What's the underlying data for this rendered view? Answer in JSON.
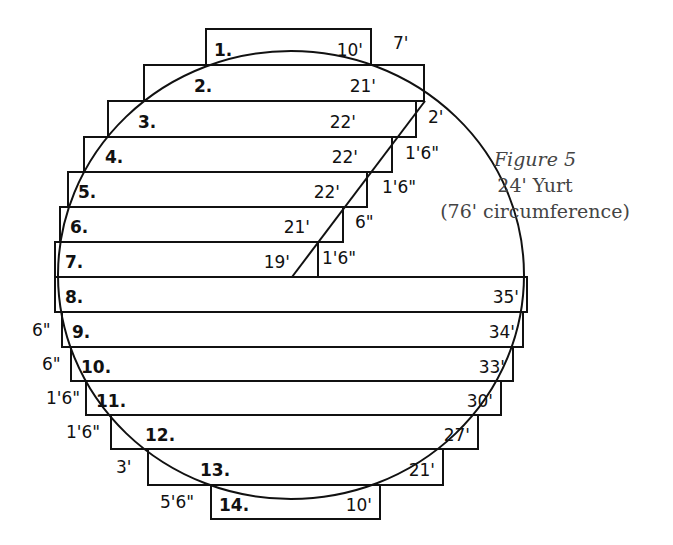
{
  "caption": {
    "title": "Figure 5",
    "line1": "24' Yurt",
    "line2": "(76' circumference)"
  },
  "rows": [
    {
      "n": "1.",
      "len": "10'",
      "x1": 206,
      "x2": 371,
      "y1": 29,
      "y2": 65
    },
    {
      "n": "2.",
      "len": "21'",
      "x1": 144,
      "x2": 424,
      "y1": 65,
      "y2": 101
    },
    {
      "n": "3.",
      "len": "22'",
      "x1": 108,
      "x2": 416,
      "y1": 101,
      "y2": 137
    },
    {
      "n": "4.",
      "len": "22'",
      "x1": 84,
      "x2": 392,
      "y1": 137,
      "y2": 172
    },
    {
      "n": "5.",
      "len": "22'",
      "x1": 68,
      "x2": 367,
      "y1": 172,
      "y2": 207
    },
    {
      "n": "6.",
      "len": "21'",
      "x1": 60,
      "x2": 343,
      "y1": 207,
      "y2": 242
    },
    {
      "n": "7.",
      "len": "19'",
      "x1": 55,
      "x2": 318,
      "y1": 242,
      "y2": 277
    },
    {
      "n": "8.",
      "len": "35'",
      "x1": 55,
      "x2": 527,
      "y1": 277,
      "y2": 312
    },
    {
      "n": "9.",
      "len": "34'",
      "x1": 62,
      "x2": 523,
      "y1": 312,
      "y2": 347
    },
    {
      "n": "10.",
      "len": "33'",
      "x1": 71,
      "x2": 513,
      "y1": 347,
      "y2": 381
    },
    {
      "n": "11.",
      "len": "30'",
      "x1": 86,
      "x2": 501,
      "y1": 381,
      "y2": 415
    },
    {
      "n": "12.",
      "len": "27'",
      "x1": 111,
      "x2": 478,
      "y1": 415,
      "y2": 449
    },
    {
      "n": "13.",
      "len": "21'",
      "x1": 148,
      "x2": 443,
      "y1": 449,
      "y2": 485
    },
    {
      "n": "14.",
      "len": "10'",
      "x1": 211,
      "x2": 380,
      "y1": 485,
      "y2": 519
    }
  ],
  "offsets_right": [
    {
      "text": "7'",
      "x": 393,
      "y": 49
    },
    {
      "text": "2'",
      "x": 428,
      "y": 123
    },
    {
      "text": "1'6\"",
      "x": 405,
      "y": 159
    },
    {
      "text": "1'6\"",
      "x": 382,
      "y": 193
    },
    {
      "text": "6\"",
      "x": 355,
      "y": 228
    },
    {
      "text": "1'6\"",
      "x": 322,
      "y": 264
    }
  ],
  "offsets_left": [
    {
      "text": "6\"",
      "x": 32,
      "y": 336
    },
    {
      "text": "6\"",
      "x": 42,
      "y": 370
    },
    {
      "text": "1'6\"",
      "x": 46,
      "y": 404
    },
    {
      "text": "1'6\"",
      "x": 66,
      "y": 438
    },
    {
      "text": "3'",
      "x": 116,
      "y": 473
    },
    {
      "text": "5'6\"",
      "x": 160,
      "y": 508
    }
  ],
  "circle": {
    "cx": 291,
    "cy": 275,
    "rx": 233,
    "ry": 224
  },
  "diagonal": {
    "x1": 425,
    "y1": 101,
    "x2": 292,
    "y2": 277
  }
}
